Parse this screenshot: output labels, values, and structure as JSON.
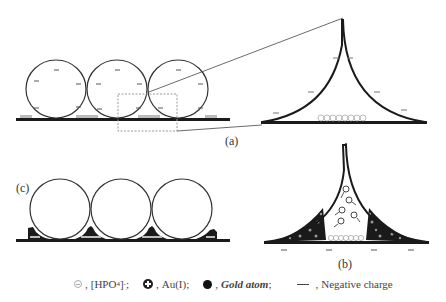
{
  "panels": {
    "a": {
      "label": "(a)",
      "description": "Three negatively charged spheres on substrate with zoom box on contact region"
    },
    "b": {
      "label": "(b)",
      "description": "Contact-region cusp with Au(I) ions diffusing and gold atoms depositing"
    },
    "c": {
      "label": "(c)",
      "description": "Three spheres with gold deposits at contact regions"
    }
  },
  "legend": {
    "hpo4": {
      "symbol": "open-circle-minus",
      "label": "[HPO",
      "sub": "4",
      "sup": "-",
      "tail": ";"
    },
    "au": {
      "symbol": "circle-plus",
      "label": "Au(I);"
    },
    "gold": {
      "symbol": "filled-circle",
      "label": "Gold atom",
      "tail": ";"
    },
    "negative": {
      "symbol": "dash",
      "label": "Negative charge"
    }
  },
  "colors": {
    "line": "#1a1a1a",
    "thin_line": "#555555",
    "dotted_box": "#888888",
    "gold_atom": "#1a1a1a",
    "hpo4": "#999999"
  }
}
